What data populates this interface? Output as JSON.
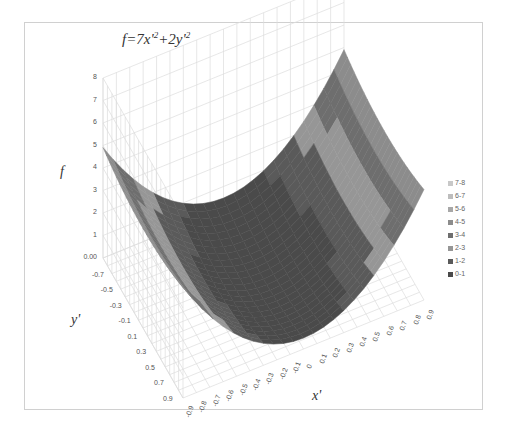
{
  "chart_data": {
    "type": "surface",
    "title_parts": {
      "lhs": "f",
      "rhs_a": "=7x'",
      "exp_a": "2",
      "plus": "+2y'",
      "exp_b": "2"
    },
    "xlabel": "x'",
    "ylabel": "y'",
    "zlabel": "f",
    "x_ticks": [
      "-0.9",
      "-0.8",
      "-0.7",
      "-0.6",
      "-0.5",
      "-0.4",
      "-0.3",
      "-0.2",
      "-0.1",
      "0",
      "0.1",
      "0.2",
      "0.3",
      "0.4",
      "0.5",
      "0.6",
      "0.7",
      "0.8",
      "0.9"
    ],
    "y_ticks": [
      "-0.7",
      "-0.5",
      "-0.3",
      "-0.1",
      "0.1",
      "0.3",
      "0.5",
      "0.7",
      "0.9"
    ],
    "z_ticks": [
      "0.00",
      "1",
      "2",
      "3",
      "4",
      "5",
      "6",
      "7",
      "8"
    ],
    "zlim": [
      0,
      8
    ],
    "xlim": [
      -0.9,
      0.9
    ],
    "ylim": [
      -0.9,
      0.9
    ],
    "legend_position": "right",
    "legend": [
      {
        "label": "7-8",
        "color": "#c8c8c8"
      },
      {
        "label": "6-7",
        "color": "#bdbdbd"
      },
      {
        "label": "5-6",
        "color": "#a8a8a8"
      },
      {
        "label": "4-5",
        "color": "#8c8c8c"
      },
      {
        "label": "3-4",
        "color": "#6e6e6e"
      },
      {
        "label": "2-3",
        "color": "#969696"
      },
      {
        "label": "1-2",
        "color": "#5a5a5a"
      },
      {
        "label": "0-1",
        "color": "#4a4a4a"
      }
    ],
    "grid": true,
    "formula": {
      "a": 7,
      "b": 2
    }
  }
}
